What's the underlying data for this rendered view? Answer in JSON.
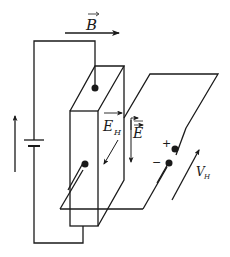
{
  "diagram": {
    "labels": {
      "magnetic_field": "B",
      "hall_field": "E",
      "hall_field_subscript": "H",
      "electric_field": "E",
      "hall_voltage": "V",
      "hall_voltage_subscript": "H",
      "plus_sign": "+",
      "minus_sign": "−"
    },
    "components": [
      {
        "id": "battery",
        "type": "battery"
      },
      {
        "id": "conductor-slab",
        "type": "rectangular prism"
      },
      {
        "id": "hall-plane",
        "type": "parallelogram plane"
      },
      {
        "id": "current-arrow",
        "type": "arrow",
        "direction": "up"
      },
      {
        "id": "b-field-arrow",
        "type": "vector arrow",
        "direction": "right"
      },
      {
        "id": "hall-voltage-arrow",
        "type": "arrow",
        "direction": "up-right"
      }
    ],
    "colors": {
      "stroke": "#1a1a1a",
      "background": "#ffffff"
    }
  }
}
